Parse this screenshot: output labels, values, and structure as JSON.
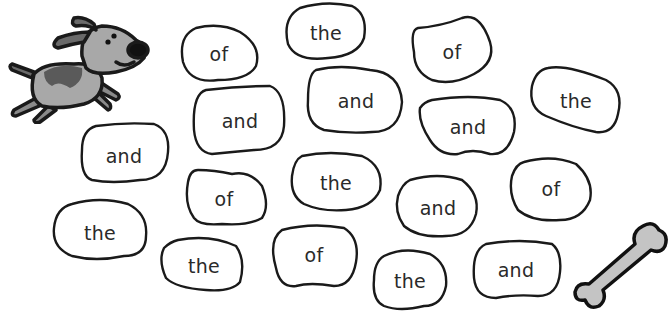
{
  "worksheet": {
    "colors": {
      "outline": "#1a1a1a",
      "dog_body": "#a8a8a8",
      "dog_spot": "#5a5a5a",
      "bone_fill": "#c4c4c4",
      "text": "#2a2a2a"
    },
    "decorations": [
      {
        "name": "dog-icon",
        "description": "cartoon running dog"
      },
      {
        "name": "bone-icon",
        "description": "cartoon dog bone"
      }
    ],
    "words": [
      {
        "text": "of",
        "cx": 219,
        "cy": 54
      },
      {
        "text": "the",
        "cx": 326,
        "cy": 33
      },
      {
        "text": "of",
        "cx": 452,
        "cy": 52
      },
      {
        "text": "the",
        "cx": 576,
        "cy": 101
      },
      {
        "text": "and",
        "cx": 240,
        "cy": 121
      },
      {
        "text": "and",
        "cx": 356,
        "cy": 101
      },
      {
        "text": "and",
        "cx": 468,
        "cy": 127
      },
      {
        "text": "and",
        "cx": 124,
        "cy": 156
      },
      {
        "text": "of",
        "cx": 224,
        "cy": 199
      },
      {
        "text": "the",
        "cx": 336,
        "cy": 183
      },
      {
        "text": "and",
        "cx": 438,
        "cy": 208
      },
      {
        "text": "of",
        "cx": 551,
        "cy": 189
      },
      {
        "text": "the",
        "cx": 100,
        "cy": 233
      },
      {
        "text": "the",
        "cx": 204,
        "cy": 266
      },
      {
        "text": "of",
        "cx": 314,
        "cy": 255
      },
      {
        "text": "the",
        "cx": 410,
        "cy": 281
      },
      {
        "text": "and",
        "cx": 516,
        "cy": 270
      }
    ]
  }
}
